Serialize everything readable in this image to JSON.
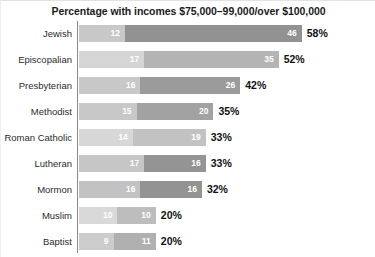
{
  "chart_data": {
    "type": "bar",
    "title": "Percentage with incomes $75,000–99,000/over $100,000",
    "xlabel": "",
    "ylabel": "",
    "orientation": "horizontal",
    "stacked": true,
    "grid": false,
    "legend_position": "none",
    "xlim": [
      0,
      60
    ],
    "categories": [
      "Jewish",
      "Episcopalian",
      "Presbyterian",
      "Methodist",
      "Roman Catholic",
      "Lutheran",
      "Mormon",
      "Muslim",
      "Baptist"
    ],
    "series": [
      {
        "name": "$75,000–99,000",
        "values": [
          12,
          17,
          16,
          15,
          14,
          17,
          16,
          10,
          9
        ]
      },
      {
        "name": "over $100,000",
        "values": [
          46,
          35,
          26,
          20,
          19,
          16,
          16,
          10,
          11
        ]
      }
    ],
    "totals": [
      58,
      52,
      42,
      35,
      33,
      33,
      32,
      20,
      20
    ],
    "total_labels": [
      "58%",
      "52%",
      "42%",
      "35%",
      "33%",
      "33%",
      "32%",
      "20%",
      "20%"
    ],
    "rows": [
      {
        "label": "Jewish",
        "seg1": 12,
        "seg1_label": "12",
        "seg2": 46,
        "seg2_label": "46",
        "total_label": "58%",
        "seg1_color": "#c8c8c8",
        "seg2_color": "#929292"
      },
      {
        "label": "Episcopalian",
        "seg1": 17,
        "seg1_label": "17",
        "seg2": 35,
        "seg2_label": "35",
        "total_label": "52%",
        "seg1_color": "#d5d5d5",
        "seg2_color": "#b4b4b4"
      },
      {
        "label": "Presbyterian",
        "seg1": 16,
        "seg1_label": "16",
        "seg2": 26,
        "seg2_label": "26",
        "total_label": "42%",
        "seg1_color": "#c8c8c8",
        "seg2_color": "#9b9b9b"
      },
      {
        "label": "Methodist",
        "seg1": 15,
        "seg1_label": "15",
        "seg2": 20,
        "seg2_label": "20",
        "total_label": "35%",
        "seg1_color": "#c8c8c8",
        "seg2_color": "#a2a2a2"
      },
      {
        "label": "Roman Catholic",
        "seg1": 14,
        "seg1_label": "14",
        "seg2": 19,
        "seg2_label": "19",
        "total_label": "33%",
        "seg1_color": "#d7d7d7",
        "seg2_color": "#c2c2c2"
      },
      {
        "label": "Lutheran",
        "seg1": 17,
        "seg1_label": "17",
        "seg2": 16,
        "seg2_label": "16",
        "total_label": "33%",
        "seg1_color": "#c6c6c6",
        "seg2_color": "#949494"
      },
      {
        "label": "Mormon",
        "seg1": 16,
        "seg1_label": "16",
        "seg2": 16,
        "seg2_label": "16",
        "total_label": "32%",
        "seg1_color": "#c2c2c2",
        "seg2_color": "#939393"
      },
      {
        "label": "Muslim",
        "seg1": 10,
        "seg1_label": "10",
        "seg2": 10,
        "seg2_label": "10",
        "total_label": "20%",
        "seg1_color": "#d9d9d9",
        "seg2_color": "#bdbdbd"
      },
      {
        "label": "Baptist",
        "seg1": 9,
        "seg1_label": "9",
        "seg2": 11,
        "seg2_label": "11",
        "total_label": "20%",
        "seg1_color": "#cccccc",
        "seg2_color": "#b0b0b0"
      }
    ],
    "scale_px_per_unit": 3.84,
    "row_top_positions": [
      5,
      31,
      57,
      83,
      109,
      135,
      161,
      187,
      213
    ]
  }
}
